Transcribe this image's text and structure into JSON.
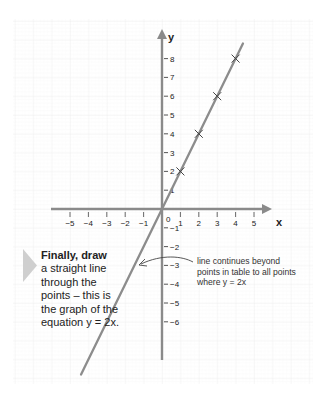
{
  "chart_data": {
    "type": "line",
    "title": "",
    "xlabel": "x",
    "ylabel": "y",
    "equation": "y = 2x",
    "xlim": [
      -5,
      5
    ],
    "ylim": [
      -6,
      8
    ],
    "x_ticks": [
      -5,
      -4,
      -3,
      -2,
      -1,
      1,
      2,
      3,
      4,
      5
    ],
    "y_ticks": [
      -6,
      -5,
      -4,
      -3,
      -2,
      -1,
      1,
      2,
      3,
      4,
      5,
      6,
      7,
      8
    ],
    "origin_label": "0",
    "grid": true,
    "series": [
      {
        "name": "y = 2x",
        "x": [
          -4.4,
          4.4
        ],
        "y": [
          -8.8,
          8.8
        ],
        "style": "line"
      },
      {
        "name": "plotted points",
        "x": [
          1,
          2,
          3,
          4
        ],
        "y": [
          2,
          4,
          6,
          8
        ],
        "style": "cross-marker"
      }
    ],
    "annotations": [
      "line continues beyond points in table to all points where y = 2x"
    ]
  },
  "labels": {
    "x_axis": "x",
    "y_axis": "y",
    "origin": "0",
    "x_ticks": [
      "−5",
      "−4",
      "−3",
      "−2",
      "−1",
      "1",
      "2",
      "3",
      "4",
      "5"
    ],
    "y_ticks_pos": [
      "1",
      "2",
      "3",
      "4",
      "5",
      "6",
      "7",
      "8"
    ],
    "y_ticks_neg": [
      "−1",
      "−2",
      "−3",
      "−4",
      "−5",
      "−6"
    ]
  },
  "note": {
    "heading": "Finally, draw",
    "body": "a straight line through the points – this is the graph of the equation y = 2x."
  },
  "callout": {
    "text": "line continues beyond points in table to all points where y = 2x"
  },
  "colors": {
    "axis": "#8a8a8a",
    "line": "#8c8c8c",
    "grid": "#f1f1f1",
    "marker_bullet": "#d0d0d0",
    "text": "#222222"
  }
}
